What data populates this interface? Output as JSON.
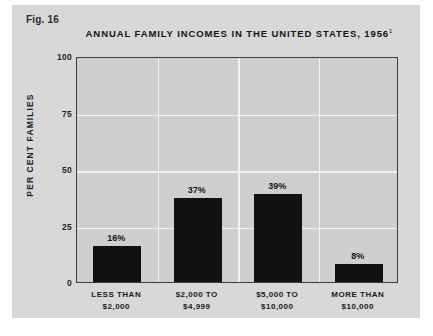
{
  "figure": {
    "number_label": "Fig. 16",
    "panel_color": "#d8d8d8",
    "plot_background": "#cfcfcf",
    "bar_color": "#111111",
    "gridline_color": "#f2f2f2",
    "axis_color": "#3a3a3a"
  },
  "chart_data": {
    "type": "bar",
    "title": "ANNUAL FAMILY INCOMES IN THE UNITED STATES, 1956",
    "title_footnote_marker": "1",
    "xlabel": "",
    "ylabel": "PER CENT FAMILIES",
    "ylim": [
      0,
      100
    ],
    "yticks": [
      0,
      25,
      50,
      75,
      100
    ],
    "ytick_labels": [
      "0",
      "25",
      "50",
      "75",
      "100"
    ],
    "grid": true,
    "legend": "none",
    "categories": [
      "LESS THAN\n$2,000",
      "$2,000 TO\n$4,999",
      "$5,000 TO\n$10,000",
      "MORE THAN\n$10,000"
    ],
    "category_lines": [
      {
        "line1": "LESS THAN",
        "line2": "$2,000"
      },
      {
        "line1": "$2,000 TO",
        "line2": "$4,999"
      },
      {
        "line1": "$5,000 TO",
        "line2": "$10,000"
      },
      {
        "line1": "MORE THAN",
        "line2": "$10,000"
      }
    ],
    "values": [
      16,
      37,
      39,
      8
    ],
    "value_labels": [
      "16%",
      "37%",
      "39%",
      "8%"
    ]
  }
}
